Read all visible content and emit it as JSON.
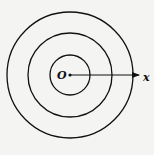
{
  "diagram": {
    "type": "concentric-circles",
    "center": {
      "x": 70,
      "y": 75,
      "label": "O"
    },
    "circles": [
      {
        "name": "inner",
        "r": 20
      },
      {
        "name": "middle",
        "r": 42
      },
      {
        "name": "outer",
        "r": 63
      }
    ],
    "axis": {
      "label": "x",
      "from_x": 70,
      "to_x": 139,
      "y": 75
    },
    "colors": {
      "stroke": "#111111",
      "background": "#f4f4f2"
    }
  }
}
